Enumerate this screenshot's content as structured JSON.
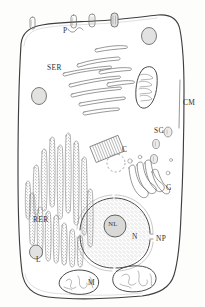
{
  "diagram": {
    "style": "hand-drawn pen and ink line diagram",
    "background_color": "#fdfdfc",
    "ink_color": "#4a4a4a"
  },
  "labels": [
    {
      "key": "P",
      "text": "P",
      "name": "label-pinocytotic-vesicle",
      "x": 63,
      "y": 33,
      "meaning": "Pinocytotic vesicle / pore"
    },
    {
      "key": "SER",
      "text": "SER",
      "name": "label-smooth-er",
      "x": 47,
      "y": 70,
      "meaning": "Smooth endoplasmic reticulum"
    },
    {
      "key": "CM",
      "text": "CM",
      "name": "label-cell-membrane",
      "x": 183,
      "y": 105,
      "meaning": "Cell membrane"
    },
    {
      "key": "SG",
      "text": "SG",
      "name": "label-secretory-granules",
      "x": 154,
      "y": 133,
      "meaning": "Secretory granules"
    },
    {
      "key": "C",
      "text": "C",
      "name": "label-centriole",
      "x": 122,
      "y": 152,
      "meaning": "Centriole"
    },
    {
      "key": "G",
      "text": "G",
      "name": "label-golgi",
      "x": 166,
      "y": 190,
      "meaning": "Golgi apparatus"
    },
    {
      "key": "RER",
      "text": "RER",
      "name": "label-rough-er",
      "x": 33,
      "y": 222,
      "meaning": "Rough endoplasmic reticulum"
    },
    {
      "key": "NL",
      "text": "NL",
      "name": "label-nucleolus",
      "x": 113,
      "y": 226,
      "meaning": "Nucleolus"
    },
    {
      "key": "N",
      "text": "N",
      "name": "label-nucleus",
      "x": 132,
      "y": 239,
      "meaning": "Nucleus"
    },
    {
      "key": "NP",
      "text": "NP",
      "name": "label-nuclear-pore",
      "x": 156,
      "y": 241,
      "meaning": "Nuclear pore"
    },
    {
      "key": "L",
      "text": "L",
      "name": "label-lysosome",
      "x": 36,
      "y": 262,
      "meaning": "Lysosome"
    },
    {
      "key": "M",
      "text": "M",
      "name": "label-mitochondrion",
      "x": 88,
      "y": 285,
      "meaning": "Mitochondrion"
    }
  ],
  "structures": {
    "cell_membrane": {
      "name": "cell-membrane",
      "description": "irregular rounded rectangle outline enclosing the cytoplasm"
    },
    "pinocytotic_vesicles": {
      "name": "pinocytotic-vesicle-group",
      "count": 4,
      "description": "small capsule shapes along the upper membrane"
    },
    "smooth_er": {
      "name": "smooth-endoplasmic-reticulum",
      "count": 10,
      "description": "smooth elongated tubules in the upper cytoplasm"
    },
    "rough_er": {
      "name": "rough-endoplasmic-reticulum",
      "count": 18,
      "description": "stippled ribosome-studded cisternae at lower left"
    },
    "mitochondria": {
      "name": "mitochondrion",
      "count": 3,
      "description": "oval organelles with internal cristae"
    },
    "golgi": {
      "name": "golgi-apparatus",
      "count": 5,
      "description": "stack of curved flattened cisternae with vesicles"
    },
    "secretory_granules": {
      "name": "secretory-granule",
      "count": 3,
      "description": "small dark ovals near the right membrane"
    },
    "centriole": {
      "name": "centriole",
      "count": 2,
      "description": "striated rectangle in side view plus dashed circle in end view"
    },
    "nucleus": {
      "name": "nucleus",
      "description": "large stippled sphere with double envelope and a pore gap"
    },
    "nucleolus": {
      "name": "nucleolus",
      "description": "small dense circle inside the nucleus"
    },
    "lysosome": {
      "name": "lysosome",
      "count": 1,
      "description": "small shaded oval at lower left"
    },
    "vacuoles": {
      "name": "vacuole",
      "count": 2,
      "description": "shaded round vesicles in the upper cytoplasm"
    }
  }
}
